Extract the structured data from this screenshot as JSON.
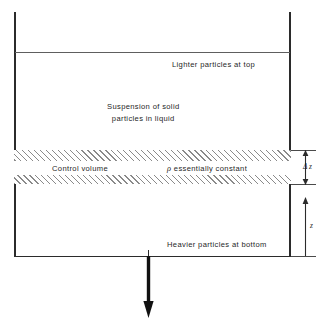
{
  "diagram": {
    "labels": {
      "lighter": "Lighter particles at top",
      "suspension_line1": "Suspension of solid",
      "suspension_line2": "particles in liquid",
      "control_volume": "Control volume",
      "rho_symbol": "ρ",
      "rho_text": " essentially constant",
      "heavier": "Heavier particles at bottom"
    },
    "dimensions": {
      "delta_z": "Δ z",
      "z": "z"
    },
    "icons": {
      "gravity_arrow": "down-arrow-icon",
      "delta_z_arrow": "double-headed-arrow-icon",
      "z_arrow": "up-arrow-icon"
    },
    "colors": {
      "outline": "#2b2b2b",
      "hatch": "#8a8a8a",
      "text": "#1f1f1f",
      "background": "#ffffff"
    }
  }
}
